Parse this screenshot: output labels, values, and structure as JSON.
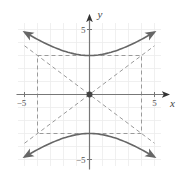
{
  "chart_data": {
    "type": "line",
    "title": "",
    "xlabel": "x",
    "ylabel": "y",
    "xlim": [
      -5,
      5
    ],
    "ylim": [
      -5,
      5
    ],
    "grid": true,
    "x_tick_labels": [
      {
        "value": -5,
        "label": "−5"
      },
      {
        "value": 5,
        "label": "5"
      }
    ],
    "y_tick_labels": [
      {
        "value": 5,
        "label": "5"
      },
      {
        "value": -5,
        "label": "−5"
      }
    ],
    "equation": "y^2/9 - x^2/16 = 1",
    "series": [
      {
        "name": "upper-branch",
        "style": "solid",
        "a": 3,
        "b": 4,
        "sign": 1,
        "x_range": [
          -5,
          5
        ]
      },
      {
        "name": "lower-branch",
        "style": "solid",
        "a": 3,
        "b": 4,
        "sign": -1,
        "x_range": [
          -5,
          5
        ]
      }
    ],
    "asymptotes": [
      {
        "name": "asymptote-positive",
        "slope": 0.75,
        "x_range": [
          -5,
          5
        ]
      },
      {
        "name": "asymptote-negative",
        "slope": -0.75,
        "x_range": [
          -5,
          5
        ]
      }
    ],
    "fundamental_rectangle": {
      "x": [
        -4,
        4
      ],
      "y": [
        -3,
        3
      ]
    },
    "center": {
      "x": 0,
      "y": 0
    },
    "colors": {
      "curve": "#666666",
      "dashed": "#9a9a9a",
      "axis": "#777777",
      "grid": "#ececec",
      "center": "#444444"
    }
  }
}
